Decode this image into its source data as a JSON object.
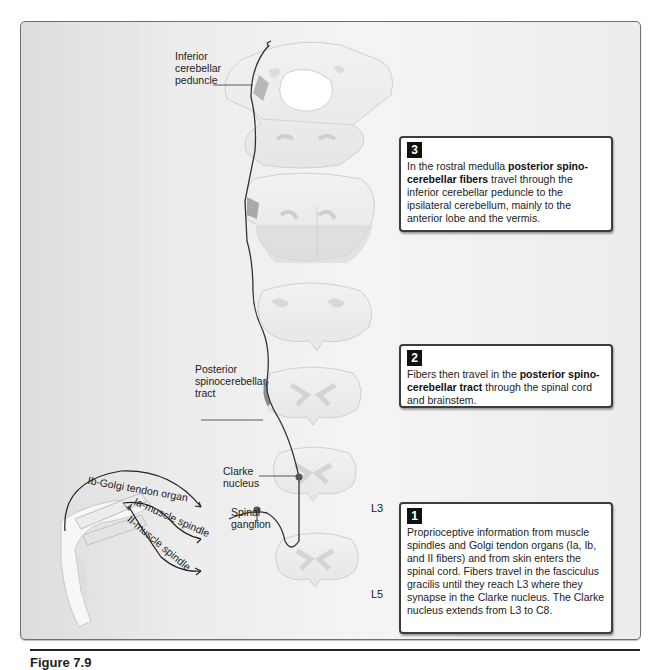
{
  "figure": {
    "caption": "Figure 7.9"
  },
  "labels": {
    "inferior_cerebellar_peduncle": [
      "Inferior",
      "cerebellar",
      "peduncle"
    ],
    "posterior_spinocerebellar_tract": [
      "Posterior",
      "spinocerebellar",
      "tract"
    ],
    "clarke_nucleus": [
      "Clarke",
      "nucleus"
    ],
    "spinal_ganglion": [
      "Spinal",
      "ganglion"
    ],
    "ib_golgi": "Ib-Golgi tendon organ",
    "ia_spindle": "Ia-muscle spindle",
    "ii_spindle": "II-muscle spindle",
    "level_l3": "L3",
    "level_l5": "L5"
  },
  "steps": [
    {
      "number": "1",
      "text_parts": [
        {
          "text": "Proprioceptive information from muscle spindles and Golgi tendon organs (Ia, Ib, and II fibers) and from skin enters the spinal cord. Fibers travel in the fasciculus gracilis until they reach L3 where they synapse in the Clarke nucleus. The Clarke nucleus extends from L3 to C8.",
          "bold": false
        }
      ]
    },
    {
      "number": "2",
      "text_parts": [
        {
          "text": "Fibers then travel in the ",
          "bold": false
        },
        {
          "text": "posterior spino- cerebellar tract",
          "bold": true
        },
        {
          "text": " through the spinal cord and brainstem.",
          "bold": false
        }
      ]
    },
    {
      "number": "3",
      "text_parts": [
        {
          "text": "In the rostral medulla ",
          "bold": false
        },
        {
          "text": "posterior spino-cerebellar fibers",
          "bold": true
        },
        {
          "text": " travel through the inferior cerebellar peduncle to the ipsilateral cerebellum, mainly to the anterior lobe and the vermis.",
          "bold": false
        }
      ]
    }
  ],
  "colors": {
    "pathway": "#333333",
    "section_fill": "#ececec",
    "section_edge": "#c8c8c8",
    "grey_matter": "#d9d9d9",
    "badge": "#111111"
  }
}
